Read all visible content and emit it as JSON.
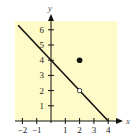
{
  "chart_data": {
    "type": "line",
    "title": "",
    "xlabel": "x",
    "ylabel": "y",
    "xlim": [
      -2.3,
      4.5
    ],
    "ylim": [
      0,
      6.6
    ],
    "grid": false,
    "x_ticks": [
      -2,
      -1,
      1,
      2,
      3,
      4
    ],
    "y_ticks": [
      1,
      2,
      3,
      4,
      5,
      6
    ],
    "x_tick_labels": [
      "−2",
      "−1",
      "1",
      "2",
      "3",
      "4"
    ],
    "y_tick_labels": [
      "1",
      "2",
      "3",
      "4",
      "5",
      "6"
    ],
    "series": [
      {
        "name": "line",
        "equation": "y = 4 - x",
        "x": [
          -2.3,
          4
        ],
        "y": [
          6.3,
          0
        ]
      }
    ],
    "points": [
      {
        "x": 2,
        "y": 2,
        "style": "open"
      },
      {
        "x": 2,
        "y": 4,
        "style": "filled"
      }
    ],
    "background_color": "#fffbc8",
    "line_color": "#111111"
  }
}
